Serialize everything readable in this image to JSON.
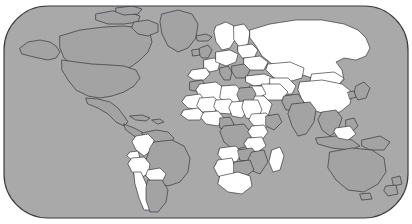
{
  "map": {
    "title": "World Map",
    "projection": "equirectangular",
    "frame": {
      "shape": "rounded-rectangle",
      "corner_radius_px": 44,
      "x": 4,
      "y": 6,
      "width": 404,
      "height": 212,
      "stroke_color": "#3b3b46",
      "stroke_width_px": 1.2
    },
    "colors": {
      "background": "#ffffff",
      "ocean": "#a9a9a9",
      "land_default": "#a3a3a3",
      "land_highlighted": "#ffffff",
      "border_stroke": "#2e2e36",
      "coast_stroke": "#2e2e36"
    },
    "legend": {
      "visible": false,
      "highlighted_label": "Highlighted",
      "default_label": "Not highlighted"
    },
    "regions_highlighted": [
      "Russia",
      "Kazakhstan",
      "Mongolia",
      "China",
      "Uzbekistan",
      "Turkmenistan",
      "Kyrgyzstan",
      "Tajikistan",
      "Afghanistan",
      "Iran",
      "Iraq",
      "Saudi Arabia",
      "Turkey",
      "Ukraine",
      "Belarus",
      "Poland",
      "Germany",
      "France",
      "Spain",
      "Finland",
      "Sweden",
      "Norway",
      "Algeria",
      "Libya",
      "Egypt",
      "Sudan",
      "Chad",
      "Niger",
      "Mali",
      "Mauritania",
      "Nigeria",
      "Ethiopia",
      "Kenya",
      "Tanzania",
      "Angola",
      "Zambia",
      "Namibia",
      "South Africa",
      "Madagascar",
      "Colombia",
      "Peru",
      "Bolivia",
      "Chile",
      "Ecuador"
    ],
    "regions_default": [
      "Canada",
      "United States",
      "Mexico",
      "Greenland",
      "Brazil",
      "Argentina",
      "India",
      "Australia",
      "New Zealand",
      "Japan",
      "Indonesia",
      "Papua New Guinea",
      "Democratic Republic of the Congo",
      "Morocco",
      "Somalia",
      "Mozambique",
      "Zimbabwe",
      "Italy",
      "Pakistan"
    ],
    "continents": [
      "North America",
      "South America",
      "Europe",
      "Africa",
      "Asia",
      "Oceania"
    ]
  }
}
